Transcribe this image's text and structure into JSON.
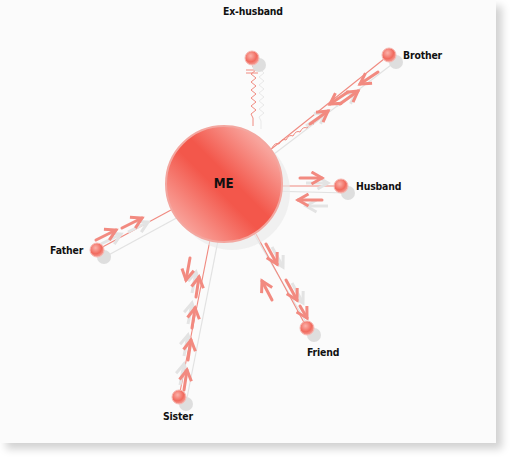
{
  "diagram": {
    "type": "relationship-map",
    "center": {
      "label": "ME",
      "x": 224,
      "y": 184,
      "r": 58,
      "color": "#f0564a"
    },
    "nodes": [
      {
        "id": "ex-husband",
        "label": "Ex-husband",
        "x": 252,
        "y": 58,
        "relation": "conflict",
        "arrows": "none"
      },
      {
        "id": "brother",
        "label": "Brother",
        "x": 389,
        "y": 55,
        "relation": "conflict",
        "arrows": "both"
      },
      {
        "id": "husband",
        "label": "Husband",
        "x": 341,
        "y": 186,
        "relation": "normal",
        "arrows": "both"
      },
      {
        "id": "father",
        "label": "Father",
        "x": 97,
        "y": 250,
        "relation": "normal",
        "arrows": "to-me"
      },
      {
        "id": "friend",
        "label": "Friend",
        "x": 307,
        "y": 328,
        "relation": "normal",
        "arrows": "both"
      },
      {
        "id": "sister",
        "label": "Sister",
        "x": 179,
        "y": 397,
        "relation": "normal",
        "arrows": "both"
      }
    ],
    "colors": {
      "accent": "#f0564a",
      "line": "#f08a80",
      "shadow": "#d9d9d9",
      "text": "#111111"
    }
  }
}
